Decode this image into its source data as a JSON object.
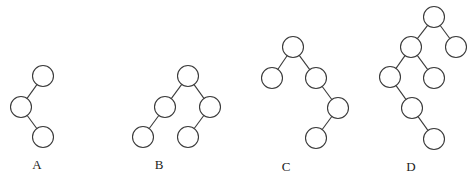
{
  "diagram": {
    "type": "binary-tree-options",
    "node_radius": 10.5,
    "stroke_color": "#3a3a3a",
    "trees": [
      {
        "label": "A",
        "label_pos": [
          37,
          164
        ],
        "nodes": [
          {
            "id": "a1",
            "x": 43,
            "y": 76
          },
          {
            "id": "a2",
            "x": 21,
            "y": 107
          },
          {
            "id": "a3",
            "x": 43,
            "y": 137
          }
        ],
        "edges": [
          [
            "a1",
            "a2"
          ],
          [
            "a2",
            "a3"
          ]
        ]
      },
      {
        "label": "B",
        "label_pos": [
          159,
          164
        ],
        "nodes": [
          {
            "id": "b1",
            "x": 188,
            "y": 76
          },
          {
            "id": "b2",
            "x": 165,
            "y": 107
          },
          {
            "id": "b3",
            "x": 210,
            "y": 107
          },
          {
            "id": "b4",
            "x": 143,
            "y": 137
          },
          {
            "id": "b5",
            "x": 188,
            "y": 137
          }
        ],
        "edges": [
          [
            "b1",
            "b2"
          ],
          [
            "b1",
            "b3"
          ],
          [
            "b2",
            "b4"
          ],
          [
            "b3",
            "b5"
          ]
        ]
      },
      {
        "label": "C",
        "label_pos": [
          286,
          166
        ],
        "nodes": [
          {
            "id": "c1",
            "x": 293,
            "y": 47
          },
          {
            "id": "c2",
            "x": 272,
            "y": 78
          },
          {
            "id": "c3",
            "x": 316,
            "y": 78
          },
          {
            "id": "c4",
            "x": 338,
            "y": 108
          },
          {
            "id": "c5",
            "x": 316,
            "y": 138
          }
        ],
        "edges": [
          [
            "c1",
            "c2"
          ],
          [
            "c1",
            "c3"
          ],
          [
            "c3",
            "c4"
          ],
          [
            "c4",
            "c5"
          ]
        ]
      },
      {
        "label": "D",
        "label_pos": [
          411,
          166
        ],
        "nodes": [
          {
            "id": "d1",
            "x": 434,
            "y": 17
          },
          {
            "id": "d2",
            "x": 411,
            "y": 47
          },
          {
            "id": "d3",
            "x": 456,
            "y": 47
          },
          {
            "id": "d4",
            "x": 390,
            "y": 77
          },
          {
            "id": "d5",
            "x": 434,
            "y": 78
          },
          {
            "id": "d6",
            "x": 412,
            "y": 108
          },
          {
            "id": "d7",
            "x": 434,
            "y": 139
          }
        ],
        "edges": [
          [
            "d1",
            "d2"
          ],
          [
            "d1",
            "d3"
          ],
          [
            "d2",
            "d4"
          ],
          [
            "d2",
            "d5"
          ],
          [
            "d4",
            "d6"
          ],
          [
            "d6",
            "d7"
          ]
        ]
      }
    ]
  }
}
